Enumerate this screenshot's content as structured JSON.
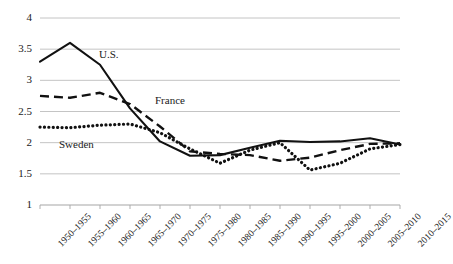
{
  "chart_data": {
    "type": "line",
    "title": "",
    "xlabel": "",
    "ylabel": "",
    "ylim": [
      1,
      4
    ],
    "yticks": [
      "1",
      "1.5",
      "2",
      "2.5",
      "3",
      "3.5",
      "4"
    ],
    "ytick_values": [
      1,
      1.5,
      2,
      2.5,
      3,
      3.5,
      4
    ],
    "grid": true,
    "legend_position": "inline-annotations",
    "categories": [
      "1950–1955",
      "1955–1960",
      "1960–1965",
      "1965–1970",
      "1970–1975",
      "1975–1980",
      "1980–1985",
      "1985–1990",
      "1990–1995",
      "1995–2000",
      "2000–2005",
      "2005–2010",
      "2010–2015"
    ],
    "series": [
      {
        "name": "U.S.",
        "style": "solid",
        "color": "#111111",
        "values": [
          3.3,
          3.6,
          3.25,
          2.55,
          2.02,
          1.79,
          1.8,
          1.92,
          2.03,
          2.01,
          2.02,
          2.07,
          1.97
        ]
      },
      {
        "name": "France",
        "style": "dashed",
        "color": "#111111",
        "values": [
          2.75,
          2.72,
          2.8,
          2.62,
          2.26,
          1.86,
          1.82,
          1.8,
          1.71,
          1.76,
          1.88,
          1.98,
          1.99
        ]
      },
      {
        "name": "Sweden",
        "style": "dotted",
        "color": "#111111",
        "values": [
          2.25,
          2.24,
          2.28,
          2.3,
          2.16,
          1.9,
          1.67,
          1.88,
          2.0,
          1.56,
          1.67,
          1.9,
          1.97
        ]
      }
    ],
    "annotations": [
      {
        "text": "U.S.",
        "x_px": 99,
        "y_px": 49
      },
      {
        "text": "France",
        "x_px": 155,
        "y_px": 95
      },
      {
        "text": "Sweden",
        "x_px": 59,
        "y_px": 139
      }
    ]
  },
  "plot_geometry": {
    "left": 40,
    "right": 400,
    "top": 18,
    "bottom": 205,
    "axis_color": "#a6a6a6",
    "grid_color": "#b5b5b5"
  }
}
